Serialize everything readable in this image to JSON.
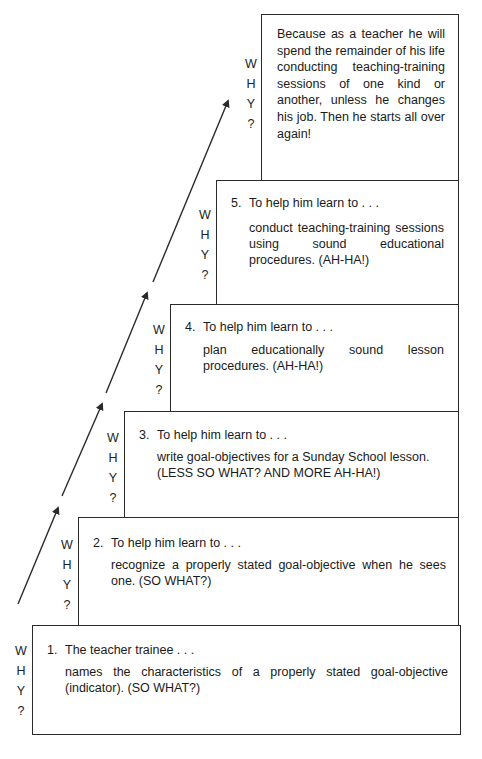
{
  "why_label": [
    "W",
    "H",
    "Y",
    "?"
  ],
  "steps": [
    {
      "number": "1.",
      "heading": "The teacher trainee . . .",
      "body": "names the characteristics of a properly stated goal-objective (indicator). (SO WHAT?)"
    },
    {
      "number": "2.",
      "heading": "To help him learn to . . .",
      "body": "recognize a properly stated goal-objective when he sees one. (SO WHAT?)"
    },
    {
      "number": "3.",
      "heading": "To help him learn to . . .",
      "body": "write goal-objectives for a Sunday School lesson. (LESS SO WHAT? AND MORE AH-HA!)"
    },
    {
      "number": "4.",
      "heading": "To help him learn to . . .",
      "body": "plan educationally sound lesson procedures. (AH-HA!)"
    },
    {
      "number": "5.",
      "heading": "To help him learn to . . .",
      "body": "conduct teaching-training sessions using sound educational procedures. (AH-HA!)"
    }
  ],
  "top_box": {
    "text": "Because as a teacher he will spend the remainder of his life conducting teaching-training sessions of one kind or another, unless he changes his job. Then he starts all over again!"
  },
  "colors": {
    "line": "#2a2a2a",
    "text": "#1a1a1a",
    "background": "#ffffff"
  }
}
